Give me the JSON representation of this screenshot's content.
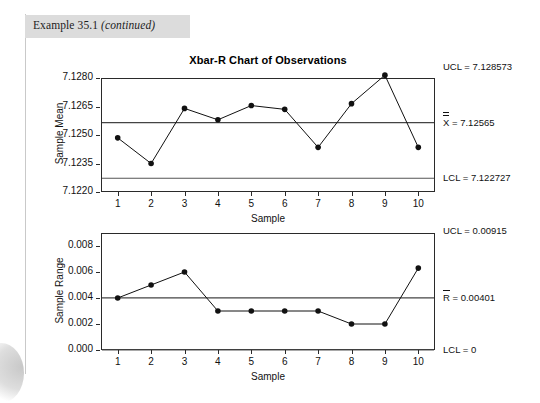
{
  "page": {
    "example_header": "Example 35.1",
    "example_header_italic": "(continued)"
  },
  "chart_title": "Xbar-R Chart of Observations",
  "chart_data": [
    {
      "type": "line",
      "id": "xbar-chart",
      "title": "Xbar-R Chart of Observations",
      "xlabel": "Sample",
      "ylabel": "Sample Mean",
      "categories": [
        1,
        2,
        3,
        4,
        5,
        6,
        7,
        8,
        9,
        10
      ],
      "values": [
        7.12485,
        7.1235,
        7.1264,
        7.1258,
        7.12655,
        7.12635,
        7.12435,
        7.12665,
        7.12815,
        7.12435
      ],
      "ylim": [
        7.122,
        7.128
      ],
      "yticks": [
        "7.1220",
        "7.1235",
        "7.1250",
        "7.1265",
        "7.1280"
      ],
      "ytick_values": [
        7.122,
        7.1235,
        7.125,
        7.1265,
        7.128
      ],
      "xticks": [
        "1",
        "2",
        "3",
        "4",
        "5",
        "6",
        "7",
        "8",
        "9",
        "10"
      ],
      "grid": false,
      "legend": "none",
      "control_limits": [
        {
          "name": "UCL",
          "label": "UCL = 7.128573",
          "value": 7.128573
        },
        {
          "name": "CL",
          "label": "= 7.12565",
          "symbol": "X",
          "symbol_overbars": 2,
          "value": 7.12565
        },
        {
          "name": "LCL",
          "label": "LCL = 7.122727",
          "value": 7.122727
        }
      ]
    },
    {
      "type": "line",
      "id": "range-chart",
      "title": "",
      "xlabel": "Sample",
      "ylabel": "Sample Range",
      "categories": [
        1,
        2,
        3,
        4,
        5,
        6,
        7,
        8,
        9,
        10
      ],
      "values": [
        0.004,
        0.005,
        0.006,
        0.003,
        0.003,
        0.003,
        0.003,
        0.002,
        0.002,
        0.0063
      ],
      "ylim": [
        0.0,
        0.009
      ],
      "yticks": [
        "0.000",
        "0.002",
        "0.004",
        "0.006",
        "0.008"
      ],
      "ytick_values": [
        0.0,
        0.002,
        0.004,
        0.006,
        0.008
      ],
      "xticks": [
        "1",
        "2",
        "3",
        "4",
        "5",
        "6",
        "7",
        "8",
        "9",
        "10"
      ],
      "grid": false,
      "legend": "none",
      "control_limits": [
        {
          "name": "UCL",
          "label": "UCL = 0.00915",
          "value": 0.00915
        },
        {
          "name": "CL",
          "label": "= 0.00401",
          "symbol": "R",
          "symbol_overbars": 1,
          "value": 0.00401
        },
        {
          "name": "LCL",
          "label": "LCL = 0",
          "value": 0.0
        }
      ]
    }
  ],
  "colors": {
    "frame": "#2a2a2a",
    "series": "#111111",
    "limit_line": "#555555",
    "center_line": "#444444",
    "band": "#dcdcdc"
  }
}
